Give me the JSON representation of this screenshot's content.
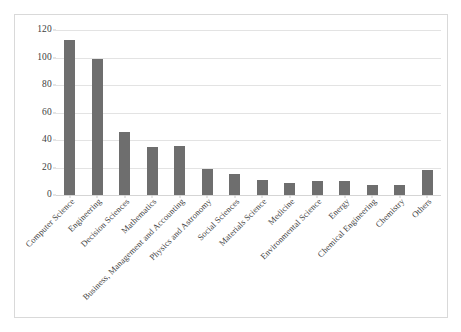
{
  "figure": {
    "bar_color": "#6e6e6e",
    "grid_color": "#e3e3e3",
    "frame_color": "#d9d9d9"
  },
  "chart_data": {
    "type": "bar",
    "title": "",
    "subtitle": "",
    "xlabel": "",
    "ylabel": "",
    "ylim": [
      0,
      120
    ],
    "yticks": [
      0,
      20,
      40,
      60,
      80,
      100,
      120
    ],
    "ytick_labels": [
      "0",
      "20",
      "40",
      "60",
      "80",
      "100",
      "120"
    ],
    "grid": true,
    "legend": false,
    "legend_position": "none",
    "orientation": "vertical",
    "categories": [
      "Computer Science",
      "Engineering",
      "Decision Sciences",
      "Mathematics",
      "Business, Management and Accounting",
      "Physics and Astronomy",
      "Social Sciences",
      "Materials Science",
      "Medicine",
      "Environmental Science",
      "Energy",
      "Chemical Engineering",
      "Chemistry",
      "Others"
    ],
    "values": [
      113,
      99,
      46,
      35,
      36,
      19,
      15,
      11,
      9,
      10,
      10,
      7,
      7,
      18
    ],
    "series": [
      {
        "name": "Documents",
        "values": [
          113,
          99,
          46,
          35,
          36,
          19,
          15,
          11,
          9,
          10,
          10,
          7,
          7,
          18
        ]
      }
    ]
  }
}
